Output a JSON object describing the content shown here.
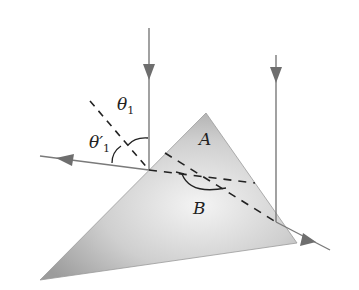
{
  "figure": {
    "labels": {
      "theta1": "θ",
      "theta1_sub": "1",
      "theta1_prime": "θ′",
      "theta1_prime_sub": "1",
      "vertex_A": "A",
      "angle_B": "B"
    },
    "colors": {
      "ray": "#7a7a7a",
      "prism_light": "#f2f2f2",
      "prism_dark": "#9a9a9a",
      "dash": "#222222"
    }
  }
}
